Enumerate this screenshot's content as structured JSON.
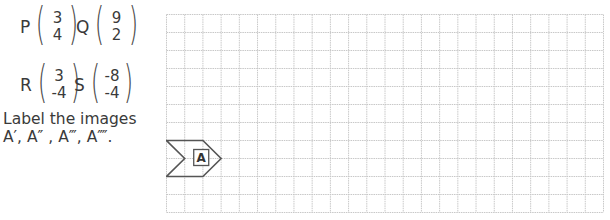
{
  "vectors": [
    {
      "name": "P",
      "top": "3",
      "bottom": "4"
    },
    {
      "name": "Q",
      "top": "9",
      "bottom": "2"
    },
    {
      "name": "R",
      "top": "3",
      "bottom": "-4"
    },
    {
      "name": "S",
      "top": "-8",
      "bottom": "-4"
    }
  ],
  "instruction": {
    "line1": "Label the images",
    "line2": "A′,  A″ , A‴, A⁗."
  },
  "grid": {
    "columns": 24,
    "rows": 11,
    "cell_size_px": 18.2,
    "line_color": "#c8c8c8"
  },
  "shape": {
    "label": "A",
    "outline_color": "#555555"
  }
}
